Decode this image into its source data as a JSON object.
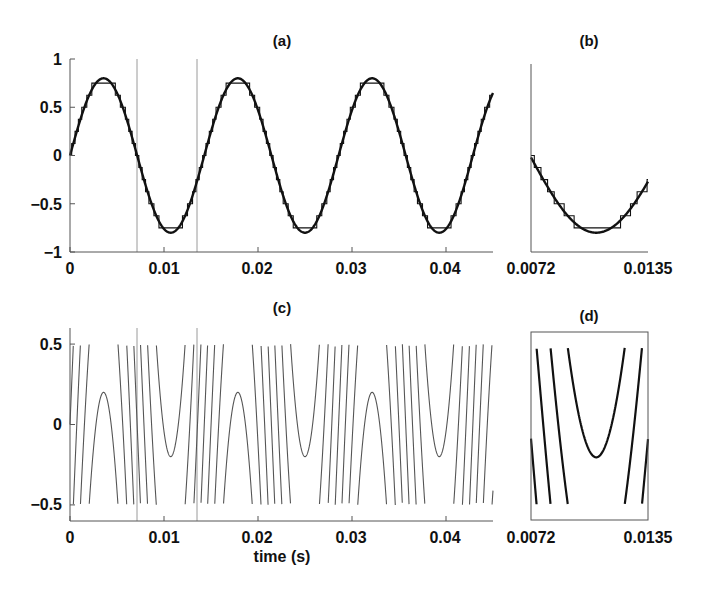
{
  "chart_data": [
    {
      "id": "a",
      "type": "line",
      "title": "(a)",
      "xlabel": "",
      "ylabel": "",
      "xlim": [
        0,
        0.045
      ],
      "ylim": [
        -1,
        1
      ],
      "xticks": [
        0,
        0.01,
        0.02,
        0.03,
        0.04
      ],
      "xtick_labels": [
        "0",
        "0.01",
        "0.02",
        "0.03",
        "0.04"
      ],
      "yticks": [
        1,
        0.5,
        0,
        -0.5,
        -1
      ],
      "ytick_labels": [
        "1",
        "0.5",
        "0",
        "−0.5",
        "−1"
      ],
      "vertical_markers": [
        0.0072,
        0.0135
      ],
      "series": [
        {
          "name": "sinusoid",
          "amplitude": 0.8,
          "frequency_hz": 70,
          "style": "thick black line"
        },
        {
          "name": "quantized (staircase)",
          "step": 0.125,
          "sample_rate_hz": 700,
          "style": "thin black steps"
        }
      ],
      "grid": false
    },
    {
      "id": "b",
      "type": "line",
      "title": "(b)",
      "xlim": [
        0.0072,
        0.0135
      ],
      "ylim": [
        -1,
        1
      ],
      "xtick_labels": [
        "0.0072",
        "0.0135"
      ],
      "description": "zoom of (a) between vertical markers",
      "grid": false
    },
    {
      "id": "c",
      "type": "line",
      "title": "(c)",
      "xlabel": "time (s)",
      "xlim": [
        0,
        0.045
      ],
      "ylim": [
        -0.6,
        0.6
      ],
      "xticks": [
        0,
        0.01,
        0.02,
        0.03,
        0.04
      ],
      "xtick_labels": [
        "0",
        "0.01",
        "0.02",
        "0.03",
        "0.04"
      ],
      "yticks": [
        0.5,
        0,
        -0.5
      ],
      "ytick_labels": [
        "0.5",
        "0",
        "−0.5"
      ],
      "vertical_markers": [
        0.0072,
        0.0135
      ],
      "series": [
        {
          "name": "error signal",
          "formula": "g*s(t) - round(g*s(t))",
          "gain": 4,
          "range": [
            -0.5,
            0.5
          ],
          "style": "thin grey line"
        }
      ],
      "grid": false
    },
    {
      "id": "d",
      "type": "line",
      "title": "(d)",
      "xlim": [
        0.0072,
        0.0135
      ],
      "ylim": [
        -0.6,
        0.6
      ],
      "xtick_labels": [
        "0.0072",
        "0.0135"
      ],
      "description": "zoom of (c) between vertical markers, boxed",
      "grid": false
    }
  ],
  "labels": {
    "title_a": "(a)",
    "title_b": "(b)",
    "title_c": "(c)",
    "title_d": "(d)",
    "xlabel_c": "time (s)",
    "a_x": [
      "0",
      "0.01",
      "0.02",
      "0.03",
      "0.04"
    ],
    "a_y": [
      "1",
      "0.5",
      "0",
      "−0.5",
      "−1"
    ],
    "b_x": [
      "0.0072",
      "0.0135"
    ],
    "c_x": [
      "0",
      "0.01",
      "0.02",
      "0.03",
      "0.04"
    ],
    "c_y": [
      "0.5",
      "0",
      "−0.5"
    ],
    "d_x": [
      "0.0072",
      "0.0135"
    ]
  },
  "colors": {
    "signal": "#111111",
    "error": "#555555",
    "axis": "#555555",
    "marker": "#9a9a9a"
  }
}
